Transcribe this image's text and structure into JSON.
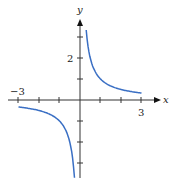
{
  "chart_data": {
    "type": "line",
    "title": "",
    "function": "y = 1/x",
    "xlabel": "x",
    "ylabel": "y",
    "xlim": [
      -3,
      3
    ],
    "ylim": [
      -4,
      4
    ],
    "grid": false,
    "x_tick_labels": [
      {
        "value": -3,
        "label": "−3"
      },
      {
        "value": 3,
        "label": "3"
      }
    ],
    "y_tick_labels": [
      {
        "value": 2,
        "label": "2"
      }
    ],
    "x_ticks": [
      -3,
      -2,
      -1,
      1,
      2,
      3
    ],
    "y_ticks": [
      -3,
      -2,
      -1,
      1,
      2,
      3
    ],
    "series": [
      {
        "name": "right-branch",
        "x": [
          0.3,
          0.4,
          0.5,
          0.75,
          1,
          1.5,
          2,
          2.5,
          3
        ],
        "y": [
          3.33,
          2.5,
          2,
          1.33,
          1,
          0.67,
          0.5,
          0.4,
          0.33
        ]
      },
      {
        "name": "left-branch",
        "x": [
          -3,
          -2.5,
          -2,
          -1.5,
          -1,
          -0.75,
          -0.5,
          -0.4,
          -0.27
        ],
        "y": [
          -0.33,
          -0.4,
          -0.5,
          -0.67,
          -1,
          -1.33,
          -2,
          -2.5,
          -3.7
        ]
      }
    ],
    "curve_color": "#3a6fc4"
  }
}
